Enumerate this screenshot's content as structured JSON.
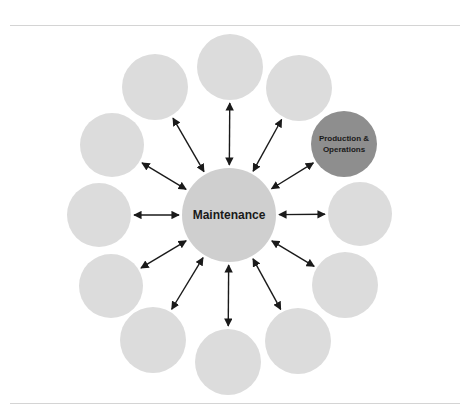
{
  "center": {
    "label": "Maintenance",
    "x": 229,
    "y": 215,
    "r": 47,
    "color": "#cfcfcf"
  },
  "nodes": [
    {
      "id": "node-0",
      "x": 230,
      "y": 67,
      "r": 33,
      "color": "#dcdcdc",
      "label": ""
    },
    {
      "id": "node-1",
      "x": 299,
      "y": 88,
      "r": 33,
      "color": "#dcdcdc",
      "label": ""
    },
    {
      "id": "node-2",
      "x": 344,
      "y": 144,
      "r": 33,
      "color": "#8e8e8e",
      "label": "Production & Operations"
    },
    {
      "id": "node-3",
      "x": 360,
      "y": 214,
      "r": 32,
      "color": "#dcdcdc",
      "label": ""
    },
    {
      "id": "node-4",
      "x": 345,
      "y": 285,
      "r": 33,
      "color": "#dcdcdc",
      "label": ""
    },
    {
      "id": "node-5",
      "x": 298,
      "y": 341,
      "r": 33,
      "color": "#dcdcdc",
      "label": ""
    },
    {
      "id": "node-6",
      "x": 228,
      "y": 362,
      "r": 33,
      "color": "#dcdcdc",
      "label": ""
    },
    {
      "id": "node-7",
      "x": 153,
      "y": 340,
      "r": 33,
      "color": "#dcdcdc",
      "label": ""
    },
    {
      "id": "node-8",
      "x": 111,
      "y": 286,
      "r": 32,
      "color": "#dcdcdc",
      "label": ""
    },
    {
      "id": "node-9",
      "x": 99,
      "y": 215,
      "r": 32,
      "color": "#dcdcdc",
      "label": ""
    },
    {
      "id": "node-10",
      "x": 112,
      "y": 145,
      "r": 32,
      "color": "#dcdcdc",
      "label": ""
    },
    {
      "id": "node-11",
      "x": 155,
      "y": 87,
      "r": 33,
      "color": "#dcdcdc",
      "label": ""
    }
  ],
  "arrow_color": "#1a1a1a",
  "rules": {
    "top_y": 25,
    "bottom_y": 403
  }
}
